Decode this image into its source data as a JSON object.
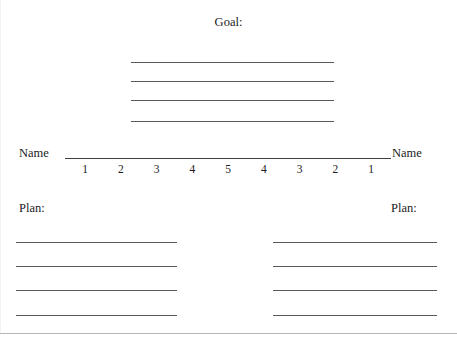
{
  "document": {
    "title": "Goal Worksheet",
    "goal_label": "Goal:",
    "name_left_label": "Name",
    "name_right_label": "Name",
    "plan_left_label": "Plan:",
    "plan_right_label": "Plan:"
  },
  "scale": {
    "numbers": [
      "1",
      "2",
      "3",
      "4",
      "5",
      "4",
      "3",
      "2",
      "1"
    ]
  },
  "goal_lines": [
    {
      "index": 1,
      "top": 62
    },
    {
      "index": 2,
      "top": 81
    },
    {
      "index": 3,
      "top": 100
    },
    {
      "index": 4,
      "top": 121
    }
  ],
  "plan_left_lines": [
    {
      "index": 1,
      "top": 242
    },
    {
      "index": 2,
      "top": 266
    },
    {
      "index": 3,
      "top": 290
    },
    {
      "index": 4,
      "top": 315
    }
  ],
  "plan_right_lines": [
    {
      "index": 1,
      "top": 242
    },
    {
      "index": 2,
      "top": 266
    },
    {
      "index": 3,
      "top": 290
    },
    {
      "index": 4,
      "top": 315
    }
  ],
  "colors": {
    "page_background": "#ffffff",
    "text": "#1c1c1c",
    "rule_line": "#555a5f",
    "divider": "#b3b6ba"
  }
}
